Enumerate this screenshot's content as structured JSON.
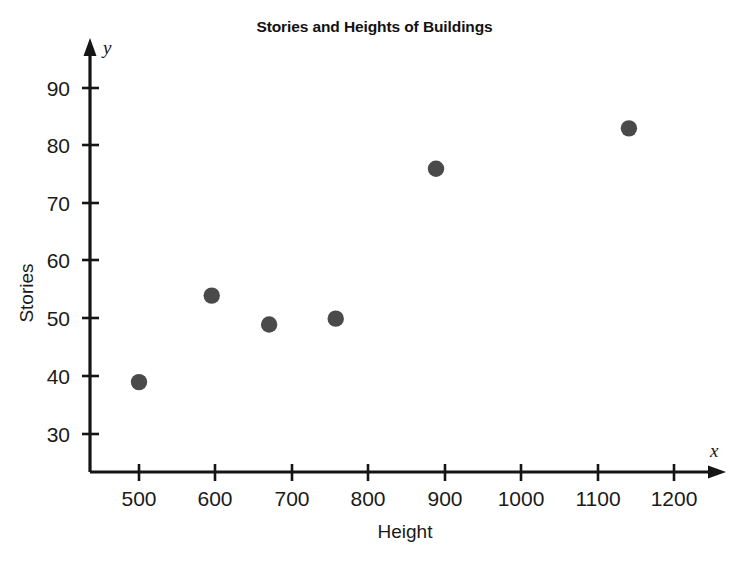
{
  "chart_data": {
    "type": "scatter",
    "title": "Stories and Heights of Buildings",
    "xlabel": "Height",
    "ylabel": "Stories",
    "x_axis_symbol": "x",
    "y_axis_symbol": "y",
    "xlim": [
      430,
      1260
    ],
    "ylim": [
      24,
      95
    ],
    "xticks": [
      500,
      600,
      700,
      800,
      900,
      1000,
      1100,
      1200
    ],
    "yticks": [
      30,
      40,
      50,
      60,
      70,
      80,
      90
    ],
    "grid": false,
    "legend": false,
    "point_color": "#4a4a4a",
    "axis_color": "#151515",
    "points": [
      {
        "x": 500,
        "y": 39
      },
      {
        "x": 595,
        "y": 54
      },
      {
        "x": 670,
        "y": 49
      },
      {
        "x": 757,
        "y": 50
      },
      {
        "x": 888,
        "y": 76
      },
      {
        "x": 1140,
        "y": 83
      }
    ]
  }
}
